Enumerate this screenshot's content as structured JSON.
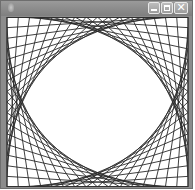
{
  "window": {
    "title": "",
    "icon": "app-icon",
    "controls": {
      "minimize": {
        "icon": "minimize-icon",
        "glyph": ""
      },
      "maximize": {
        "icon": "maximize-icon",
        "glyph": ""
      },
      "close": {
        "icon": "close-icon",
        "glyph": "✕"
      }
    },
    "colors": {
      "titlebar": "#8a8a8a",
      "frame": "#8c8c8c",
      "canvas_bg": "#ffffff",
      "line": "#2a2a2a"
    }
  },
  "canvas": {
    "pattern": "curve-stitching",
    "divisions": 16,
    "width": 181,
    "height": 170,
    "line_width": 0.9
  }
}
